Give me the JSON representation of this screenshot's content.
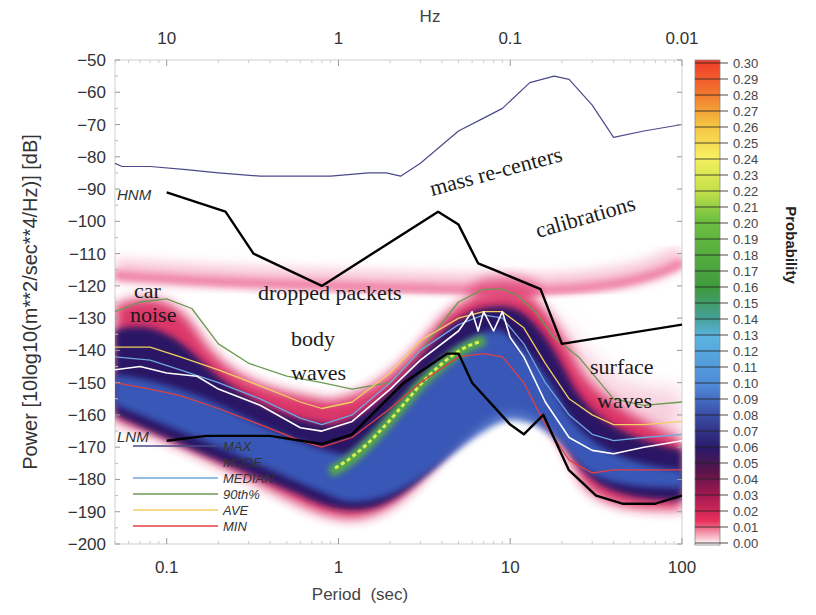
{
  "chart_data": {
    "type": "heatmap",
    "xlabel": "Period  (sec)",
    "xlabel_top": "Hz",
    "ylabel": "Power [10log10(m**2/sec**4/Hz)] [dB]",
    "x_scale": "log",
    "xlim": [
      0.05,
      100
    ],
    "ylim": [
      -200,
      -50
    ],
    "x_ticks": [
      "0.1",
      "1",
      "10",
      "100"
    ],
    "x_ticks_top": [
      "10",
      "1",
      "0.1",
      "0.01"
    ],
    "y_ticks": [
      "-50",
      "-60",
      "-70",
      "-80",
      "-90",
      "-100",
      "-110",
      "-120",
      "-130",
      "-140",
      "-150",
      "-160",
      "-170",
      "-180",
      "-190",
      "-200"
    ],
    "colorbar": {
      "label": "Probability",
      "min": 0.0,
      "max": 0.3,
      "ticks": [
        "0.30",
        "0.29",
        "0.28",
        "0.27",
        "0.26",
        "0.25",
        "0.24",
        "0.23",
        "0.22",
        "0.21",
        "0.20",
        "0.19",
        "0.18",
        "0.17",
        "0.16",
        "0.15",
        "0.14",
        "0.13",
        "0.12",
        "0.11",
        "0.10",
        "0.09",
        "0.08",
        "0.07",
        "0.06",
        "0.05",
        "0.04",
        "0.03",
        "0.02",
        "0.01",
        "0.00"
      ]
    },
    "annotations": [
      {
        "text": "mass re-centers",
        "x": 2.5,
        "y": -88
      },
      {
        "text": "calibrations",
        "x": 20,
        "y": -100
      },
      {
        "text": "car",
        "x": 0.1,
        "y": -125
      },
      {
        "text": "noise",
        "x": 0.1,
        "y": -132
      },
      {
        "text": "dropped packets",
        "x": 2,
        "y": -123
      },
      {
        "text": "body",
        "x": 1.3,
        "y": -137
      },
      {
        "text": "waves",
        "x": 1.3,
        "y": -147
      },
      {
        "text": "surface",
        "x": 40,
        "y": -147
      },
      {
        "text": "waves",
        "x": 40,
        "y": -157
      },
      {
        "text": "HNM",
        "x": 0.06,
        "y": -92
      },
      {
        "text": "LNM",
        "x": 0.06,
        "y": -167
      }
    ],
    "series": [
      {
        "name": "MAX",
        "color": "#4a4a8a",
        "x": [
          0.05,
          0.055,
          0.08,
          0.13,
          0.2,
          0.35,
          0.6,
          0.9,
          1.5,
          1.9,
          2.3,
          3,
          5,
          7,
          9,
          13,
          18,
          22,
          30,
          40,
          60,
          100
        ],
        "values": [
          -82,
          -83,
          -83,
          -84,
          -85,
          -86,
          -86,
          -86,
          -85,
          -85,
          -86,
          -82,
          -72,
          -68,
          -65,
          -57,
          -55,
          -56,
          -64,
          -74,
          -72,
          -70
        ]
      },
      {
        "name": "HNM",
        "color": "#000000",
        "x": [
          0.1,
          0.22,
          0.32,
          0.8,
          3.8,
          5,
          6.5,
          8,
          15,
          20,
          100
        ],
        "values": [
          -91,
          -97,
          -110,
          -120,
          -97,
          -101,
          -113,
          -115,
          -121,
          -138,
          -132
        ]
      },
      {
        "name": "LNM",
        "color": "#000000",
        "x": [
          0.1,
          0.17,
          0.4,
          0.8,
          1.2,
          2.4,
          4.3,
          5,
          6,
          10,
          12,
          15.6,
          21.9,
          31.6,
          45,
          70,
          100
        ],
        "values": [
          -168,
          -166.5,
          -166.5,
          -169,
          -166,
          -150,
          -141,
          -141,
          -150,
          -163,
          -166,
          -160,
          -177,
          -185,
          -187.5,
          -187.5,
          -185
        ]
      },
      {
        "name": "MEDIAN",
        "color": "#6ea8e0",
        "x": [
          0.05,
          0.08,
          0.12,
          0.2,
          0.35,
          0.6,
          0.8,
          1.2,
          2,
          3,
          5,
          7,
          9,
          12,
          16,
          22,
          30,
          40,
          60,
          100
        ],
        "values": [
          -142,
          -143,
          -146,
          -150,
          -155,
          -161,
          -163,
          -160,
          -150,
          -140,
          -132,
          -129,
          -130,
          -138,
          -150,
          -160,
          -166,
          -168,
          -167,
          -166
        ]
      },
      {
        "name": "90th%",
        "color": "#6a9a50",
        "x": [
          0.05,
          0.07,
          0.1,
          0.14,
          0.2,
          0.3,
          0.5,
          0.8,
          1.2,
          2,
          3,
          5,
          7,
          9,
          11,
          14,
          18,
          25,
          40,
          60,
          100
        ],
        "values": [
          -128,
          -125,
          -124,
          -127,
          -138,
          -144,
          -148,
          -150,
          -152,
          -150,
          -140,
          -125,
          -121,
          -121,
          -123,
          -128,
          -136,
          -142,
          -155,
          -157,
          -156
        ]
      },
      {
        "name": "AVE",
        "color": "#f0d060",
        "x": [
          0.05,
          0.08,
          0.12,
          0.2,
          0.35,
          0.6,
          0.8,
          1.2,
          2,
          3,
          5,
          7,
          9,
          12,
          16,
          22,
          30,
          40,
          60,
          100
        ],
        "values": [
          -139,
          -139,
          -142,
          -146,
          -151,
          -156,
          -158,
          -156,
          -147,
          -137,
          -130,
          -128,
          -128,
          -133,
          -144,
          -155,
          -160,
          -163,
          -163,
          -162
        ]
      },
      {
        "name": "MIN",
        "color": "#e04040",
        "x": [
          0.05,
          0.08,
          0.12,
          0.2,
          0.35,
          0.6,
          0.8,
          1.2,
          2,
          3,
          5,
          7,
          9,
          12,
          16,
          22,
          30,
          40,
          60,
          100
        ],
        "values": [
          -150,
          -152,
          -154,
          -158,
          -163,
          -168,
          -170,
          -167,
          -158,
          -150,
          -142,
          -141,
          -142,
          -150,
          -163,
          -174,
          -178,
          -177,
          -177,
          -177
        ]
      },
      {
        "name": "MODE",
        "color": "#ffffff",
        "x": [
          0.05,
          0.07,
          0.1,
          0.15,
          0.2,
          0.35,
          0.6,
          0.8,
          1.2,
          2,
          3,
          5,
          6,
          6.5,
          7,
          8,
          9,
          10,
          12,
          16,
          22,
          30,
          40,
          60,
          100
        ],
        "values": [
          -146,
          -145,
          -147,
          -148,
          -152,
          -157,
          -164,
          -165,
          -162,
          -152,
          -143,
          -134,
          -128,
          -134,
          -128,
          -134,
          -128,
          -136,
          -142,
          -156,
          -167,
          -171,
          -172,
          -170,
          -168
        ]
      }
    ],
    "legend": {
      "position": "lower-left",
      "entries": [
        {
          "label": "MAX",
          "color": "#4a4a8a"
        },
        {
          "label": "MODE",
          "color": "#ffffff"
        },
        {
          "label": "MEDIAN",
          "color": "#6ea8e0"
        },
        {
          "label": "90th%",
          "color": "#6a9a50"
        },
        {
          "label": "AVE",
          "color": "#f0d060"
        },
        {
          "label": "MIN",
          "color": "#e04040"
        }
      ]
    },
    "grid": false
  },
  "labels": {
    "xlabel": "Period  (sec)",
    "xlabel_top": "Hz",
    "ylabel": "Power [10log10(m**2/sec**4/Hz)] [dB]",
    "colorbar_title": "Probability",
    "hnm": "HNM",
    "lnm": "LNM",
    "annot_mass": "mass re-centers",
    "annot_calib": "calibrations",
    "annot_car": "car",
    "annot_noise": "noise",
    "annot_dropped": "dropped packets",
    "annot_body": "body",
    "annot_bodywaves": "waves",
    "annot_surface": "surface",
    "annot_surfacewaves": "waves"
  },
  "legend_labels": [
    "MAX",
    "MODE",
    "MEDIAN",
    "90th%",
    "AVE",
    "MIN"
  ]
}
